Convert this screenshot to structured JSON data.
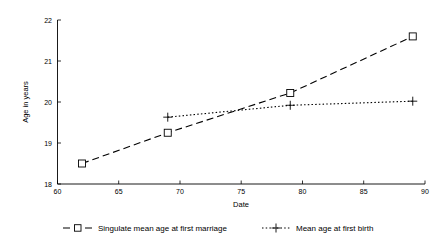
{
  "chart_data": {
    "type": "line",
    "title": "",
    "xlabel": "Date",
    "ylabel": "Age in years",
    "xlim": [
      60,
      90
    ],
    "ylim": [
      18,
      22
    ],
    "xticks": [
      60,
      65,
      70,
      75,
      80,
      85,
      90
    ],
    "yticks": [
      18,
      19,
      20,
      21,
      22
    ],
    "xtick_labels": [
      "60",
      "65",
      "70",
      "75",
      "80",
      "85",
      "90"
    ],
    "ytick_labels": [
      "18",
      "19",
      "20",
      "21",
      "22"
    ],
    "grid": false,
    "legend_position": "bottom",
    "series": [
      {
        "name": "Singulate mean age at first marriage",
        "marker": "open-square",
        "linestyle": "dashed",
        "x": [
          62,
          69,
          79,
          89
        ],
        "values": [
          18.5,
          19.25,
          20.22,
          21.6
        ]
      },
      {
        "name": "Mean age at first birth",
        "marker": "plus",
        "linestyle": "dotted",
        "x": [
          69,
          79,
          89
        ],
        "values": [
          19.63,
          19.92,
          20.02
        ]
      }
    ]
  },
  "axes": {
    "x_title": "Date",
    "y_title": "Age in years"
  },
  "legend": {
    "entries": [
      {
        "label": "Singulate mean age at first marriage"
      },
      {
        "label": "Mean age at first birth"
      }
    ]
  },
  "colors": {
    "line": "#000000",
    "background": "#ffffff",
    "text": "#000000"
  }
}
